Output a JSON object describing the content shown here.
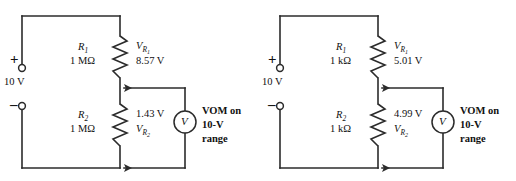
{
  "diagram": {
    "stroke_color": "#2b2b2b",
    "background": "#ffffff",
    "circuits": [
      {
        "id": "left",
        "source": {
          "value": "10 V",
          "plus": "+",
          "minus": "–"
        },
        "r1": {
          "name": "R",
          "sub": "1",
          "value": "1 MΩ",
          "v_label_main": "V",
          "v_label_sub": "R",
          "v_label_subsub": "1",
          "v_value": "8.57 V"
        },
        "r2": {
          "name": "R",
          "sub": "2",
          "value": "1 MΩ",
          "v_label_main": "V",
          "v_label_sub": "R",
          "v_label_subsub": "2",
          "v_value": "1.43 V"
        },
        "meter": {
          "symbol": "V",
          "line1": "VOM on",
          "line2": "10-V",
          "line3": "range"
        }
      },
      {
        "id": "right",
        "source": {
          "value": "10 V",
          "plus": "+",
          "minus": "–"
        },
        "r1": {
          "name": "R",
          "sub": "1",
          "value": "1 kΩ",
          "v_label_main": "V",
          "v_label_sub": "R",
          "v_label_subsub": "1",
          "v_value": "5.01 V"
        },
        "r2": {
          "name": "R",
          "sub": "2",
          "value": "1 kΩ",
          "v_label_main": "V",
          "v_label_sub": "R",
          "v_label_subsub": "2",
          "v_value": "4.99 V"
        },
        "meter": {
          "symbol": "V",
          "line1": "VOM on",
          "line2": "10-V",
          "line3": "range"
        }
      }
    ]
  }
}
